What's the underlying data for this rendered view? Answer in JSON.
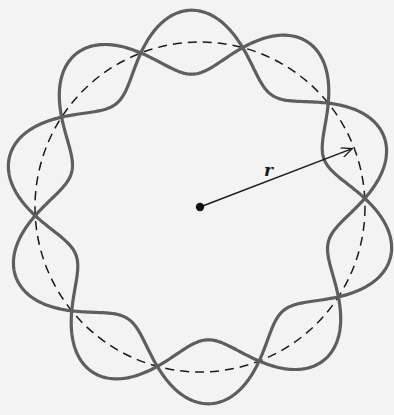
{
  "diagram": {
    "radius_label": "r",
    "center": [
      200,
      207
    ],
    "radius": 165,
    "wave_amplitude": 32,
    "wavelengths": 5,
    "node_phase_deg": 3,
    "colors": {
      "wave": "#5e5e5e",
      "circle": "#1a1a1a",
      "arrow": "#1a1a1a",
      "background": "#f3f3f3"
    }
  }
}
